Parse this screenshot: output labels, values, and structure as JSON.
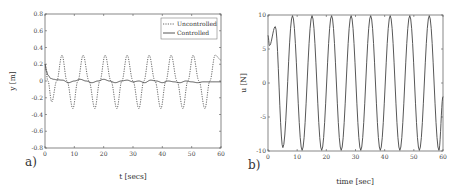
{
  "chart_data": [
    {
      "type": "line",
      "panel_label": "a)",
      "title": "",
      "xlabel": "t [secs]",
      "ylabel": "y [m]",
      "xlim": [
        0,
        60
      ],
      "ylim": [
        -0.8,
        0.8
      ],
      "xticks": [
        0,
        10,
        20,
        30,
        40,
        50,
        60
      ],
      "yticks": [
        0.8,
        0.6,
        0.4,
        0.2,
        0,
        -0.2,
        -0.4,
        -0.6,
        -0.8
      ],
      "ytick_labels": [
        "0.8",
        "0.6",
        "0.4",
        "0.2",
        "0",
        "-0.2",
        "-0.4",
        "-0.6",
        "-0.8"
      ],
      "grid": false,
      "legend_position": "upper right",
      "series": [
        {
          "name": "Uncontrolled",
          "style": "dotted",
          "x": [
            0,
            1,
            2.3,
            4,
            5.8,
            7.5,
            9.5,
            11.2,
            13,
            15,
            17,
            18.7,
            20.5,
            22.5,
            24.5,
            26.2,
            28,
            30,
            32,
            33.7,
            35.5,
            37.5,
            39.5,
            41.2,
            43,
            45,
            47,
            48.7,
            50.5,
            52.5,
            54.5,
            56.2,
            58,
            60
          ],
          "y": [
            0.2,
            0.0,
            -0.25,
            0.0,
            0.31,
            0.0,
            -0.33,
            0.0,
            0.31,
            0.0,
            -0.33,
            0.0,
            0.31,
            0.0,
            -0.33,
            0.0,
            0.31,
            0.0,
            -0.33,
            0.0,
            0.31,
            0.0,
            -0.33,
            0.0,
            0.31,
            0.0,
            -0.33,
            0.0,
            0.31,
            0.0,
            -0.33,
            0.0,
            0.31,
            0.25
          ]
        },
        {
          "name": "Controlled",
          "style": "solid",
          "x": [
            0,
            0.5,
            1,
            2,
            3,
            4,
            6,
            8,
            10,
            12,
            14,
            16,
            18,
            20,
            22,
            24,
            26,
            28,
            30,
            32,
            34,
            36,
            38,
            40,
            42,
            44,
            46,
            48,
            50,
            52,
            54,
            56,
            58,
            60
          ],
          "y": [
            0.2,
            0.12,
            0.07,
            0.03,
            0.02,
            0.015,
            0.01,
            -0.02,
            0.0,
            0.02,
            0.0,
            -0.02,
            0.0,
            0.02,
            0.0,
            -0.02,
            0.0,
            0.01,
            -0.01,
            0.0,
            -0.02,
            0.01,
            0.0,
            -0.02,
            0.0,
            -0.01,
            -0.02,
            0.0,
            -0.01,
            -0.02,
            -0.01,
            -0.01,
            -0.01,
            -0.01
          ]
        }
      ]
    },
    {
      "type": "line",
      "panel_label": "b)",
      "title": "",
      "xlabel": "time [sec]",
      "ylabel": "u [N]",
      "xlim": [
        0,
        60
      ],
      "ylim": [
        -10,
        10
      ],
      "xticks": [
        0,
        10,
        20,
        30,
        40,
        50,
        60
      ],
      "yticks": [
        10,
        5,
        0,
        -5,
        -10
      ],
      "ytick_labels": [
        "10",
        "5",
        "0",
        "-5",
        "-10"
      ],
      "grid": false,
      "series": [
        {
          "name": "u",
          "style": "solid",
          "x": [
            0,
            0.5,
            2.5,
            5.1,
            8.4,
            11.7,
            15.1,
            18.4,
            21.8,
            25.1,
            28.5,
            31.8,
            35.2,
            38.5,
            41.9,
            45.2,
            48.6,
            51.9,
            55.3,
            58.6,
            60
          ],
          "y": [
            7.0,
            5.5,
            8.3,
            -9.5,
            9.9,
            -9.9,
            9.9,
            -9.9,
            9.9,
            -9.9,
            9.9,
            -9.9,
            9.9,
            -9.9,
            9.9,
            -9.9,
            9.9,
            -9.9,
            9.9,
            -9.9,
            -2.0
          ]
        }
      ]
    }
  ]
}
